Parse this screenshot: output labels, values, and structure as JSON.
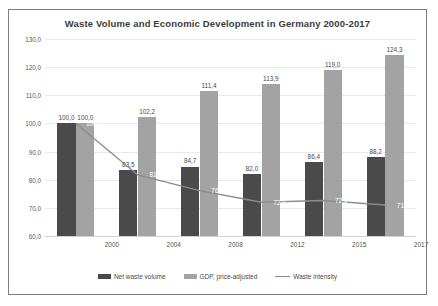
{
  "chart_data": {
    "type": "bar",
    "title": "Waste Volume and Economic Development in Germany 2000-2017",
    "xlabel": "",
    "ylabel": "",
    "ylim": [
      60.0,
      130.0
    ],
    "ytick_step": 10.0,
    "grid": true,
    "legend_position": "bottom",
    "categories": [
      "2000",
      "2004",
      "2008",
      "2012",
      "2015",
      "2017"
    ],
    "ytick_labels": [
      "60,0",
      "70,0",
      "80,0",
      "90,0",
      "100,0",
      "110,0",
      "120,0",
      "130,0"
    ],
    "ytick_values": [
      60.0,
      70.0,
      80.0,
      90.0,
      100.0,
      110.0,
      120.0,
      130.0
    ],
    "series": [
      {
        "name": "Net waste volume",
        "type": "bar",
        "color": "#4a4a4a",
        "values": [
          100.0,
          83.5,
          84.7,
          82.0,
          86.4,
          88.2
        ],
        "labels": [
          "100,0",
          "83,5",
          "84,7",
          "82,0",
          "86,4",
          "88,2"
        ]
      },
      {
        "name": "GDP, price-adjusted",
        "type": "bar",
        "color": "#a3a3a3",
        "values": [
          100.0,
          102.2,
          111.4,
          113.9,
          119.0,
          124.3
        ],
        "labels": [
          "100,0",
          "102,2",
          "111,4",
          "113,9",
          "119,0",
          "124,3"
        ]
      },
      {
        "name": "Waste intensity",
        "type": "line",
        "color": "#8c8c8c",
        "values": [
          100.0,
          81.7,
          76.1,
          72.0,
          72.6,
          71.0
        ],
        "labels": [
          "100,0",
          "81,7",
          "76,1",
          "72,0",
          "72,6",
          "71,0"
        ]
      }
    ]
  }
}
